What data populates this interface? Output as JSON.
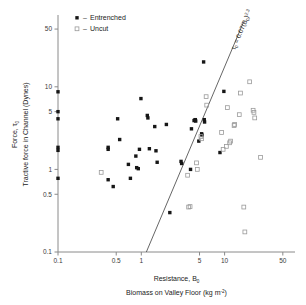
{
  "chart_data": {
    "type": "scatter",
    "title": "",
    "xlabel": "Resistance, B₀ — Biomass on Valley Floor (kg m⁻²)",
    "ylabel": "Force, τ₀ — Tractive force in Channel (Dynes)",
    "xscale": "log",
    "yscale": "log",
    "xlim": [
      0.1,
      70
    ],
    "ylim": [
      0.1,
      70
    ],
    "xticks": [
      "0.1",
      "0.5",
      "1",
      "5",
      "10",
      "50"
    ],
    "xtick_values": [
      0.1,
      0.5,
      1,
      5,
      10,
      50
    ],
    "yticks": [
      "0.1",
      "0.5",
      "1",
      "5",
      "10",
      "50"
    ],
    "ytick_values": [
      0.1,
      0.5,
      1,
      5,
      10,
      50
    ],
    "grid": false,
    "legend_position": "top-left",
    "annotation": "τ₀ = 0.07(B₀)",
    "annotation_exponent": "2.3",
    "fit_line": {
      "label": "tau = 0.07 B^2.3",
      "x_start": 1.15,
      "x_end": 17.0,
      "y_start": 0.1,
      "y_end": 62.0
    },
    "series": [
      {
        "name": "Entrenched",
        "marker": "filled-square",
        "points": [
          [
            0.1,
            8.7
          ],
          [
            0.1,
            5.0
          ],
          [
            0.1,
            4.1
          ],
          [
            0.1,
            1.85
          ],
          [
            0.1,
            1.7
          ],
          [
            0.1,
            0.78
          ],
          [
            0.4,
            1.85
          ],
          [
            0.4,
            1.75
          ],
          [
            0.4,
            0.75
          ],
          [
            0.46,
            0.62
          ],
          [
            0.52,
            4.1
          ],
          [
            0.55,
            2.3
          ],
          [
            0.7,
            1.15
          ],
          [
            0.74,
            0.78
          ],
          [
            0.86,
            1.45
          ],
          [
            0.88,
            1.05
          ],
          [
            0.92,
            1.02
          ],
          [
            0.95,
            1.75
          ],
          [
            0.99,
            7.2
          ],
          [
            1.18,
            4.5
          ],
          [
            1.2,
            4.2
          ],
          [
            1.25,
            1.78
          ],
          [
            1.45,
            3.3
          ],
          [
            1.5,
            1.68
          ],
          [
            1.55,
            1.22
          ],
          [
            2.0,
            3.5
          ],
          [
            2.2,
            0.3
          ],
          [
            3.0,
            1.25
          ],
          [
            3.05,
            1.18
          ],
          [
            3.9,
            1.0
          ],
          [
            4.0,
            3.1
          ],
          [
            4.3,
            3.9
          ],
          [
            4.4,
            3.95
          ],
          [
            4.45,
            4.0
          ],
          [
            4.5,
            3.85
          ],
          [
            4.9,
            2.2
          ],
          [
            5.3,
            2.7
          ],
          [
            5.35,
            2.6
          ],
          [
            5.6,
            20.0
          ],
          [
            5.7,
            4.0
          ],
          [
            5.75,
            3.75
          ],
          [
            8.8,
            1.6
          ],
          [
            9.8,
            8.8
          ]
        ]
      },
      {
        "name": "Uncut",
        "marker": "open-square",
        "points": [
          [
            0.33,
            0.92
          ],
          [
            3.6,
            0.85
          ],
          [
            3.7,
            0.35
          ],
          [
            3.85,
            0.355
          ],
          [
            4.6,
            1.2
          ],
          [
            4.7,
            1.0
          ],
          [
            5.2,
            2.5
          ],
          [
            5.3,
            2.35
          ],
          [
            6.0,
            7.6
          ],
          [
            6.1,
            6.0
          ],
          [
            9.2,
            2.8
          ],
          [
            9.6,
            1.75
          ],
          [
            10.5,
            1.9
          ],
          [
            10.8,
            5.6
          ],
          [
            11.5,
            2.1
          ],
          [
            11.8,
            2.2
          ],
          [
            13.0,
            3.4
          ],
          [
            13.2,
            3.5
          ],
          [
            15.0,
            4.6
          ],
          [
            15.5,
            8.4
          ],
          [
            17.0,
            0.35
          ],
          [
            17.5,
            0.175
          ],
          [
            20.0,
            11.5
          ],
          [
            22.0,
            5.2
          ],
          [
            22.5,
            4.9
          ],
          [
            23.0,
            4.2
          ],
          [
            27.0,
            1.4
          ]
        ]
      }
    ]
  },
  "legend": {
    "separator": "–",
    "items": [
      {
        "label": "Entrenched",
        "marker": "filled-square"
      },
      {
        "label": "Uncut",
        "marker": "open-square"
      }
    ]
  },
  "axes": {
    "y": {
      "line1": "Force, τ",
      "line1_sub": "0",
      "line2": "Tractive force in Channel (Dynes)"
    },
    "x": {
      "line1": "Resistance, B",
      "line1_sub": "0",
      "line2_pre": "Biomass on Valley Floor (kg m",
      "line2_sup": "-2",
      "line2_post": ")"
    }
  },
  "colors": {
    "axis": "#8a8a8a",
    "filled_marker": "#161616",
    "open_marker": "#9a9a9a",
    "fit_line": "#555555",
    "text": "#222222",
    "background": "#ffffff"
  }
}
